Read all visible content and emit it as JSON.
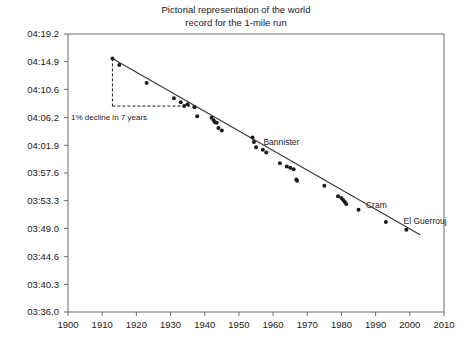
{
  "chart_data": {
    "type": "scatter",
    "title": "Pictorial representation of the world\nrecord for the 1-mile run",
    "xlabel": "",
    "ylabel": "",
    "xlim": [
      1900,
      2010
    ],
    "ylim_seconds": [
      216.0,
      259.2
    ],
    "grid": false,
    "legend": null,
    "xticks": [
      1900,
      1910,
      1920,
      1930,
      1940,
      1950,
      1960,
      1970,
      1980,
      1990,
      2000,
      2010
    ],
    "xtick_labels": [
      "1900",
      "1910",
      "1920",
      "1930",
      "1940",
      "1950",
      "1960",
      "1970",
      "1980",
      "1990",
      "2000",
      "2010"
    ],
    "yticks_seconds": [
      259.2,
      254.9,
      250.6,
      246.2,
      241.9,
      237.6,
      233.3,
      229.0,
      224.6,
      220.3,
      216.0
    ],
    "ytick_labels": [
      "04:19.2",
      "04:14.9",
      "04:10.6",
      "04:06.2",
      "04:01.9",
      "03:57.6",
      "03:53.3",
      "03:49.0",
      "03:44.6",
      "03:40.3",
      "03:36.0"
    ],
    "series": [
      {
        "name": "world record",
        "marker": "filled-circle",
        "color": "#1a1a1a",
        "points": [
          {
            "x": 1913,
            "y": 255.4
          },
          {
            "x": 1915,
            "y": 254.4
          },
          {
            "x": 1923,
            "y": 251.6
          },
          {
            "x": 1931,
            "y": 249.2
          },
          {
            "x": 1933,
            "y": 248.6
          },
          {
            "x": 1934,
            "y": 248.0
          },
          {
            "x": 1935,
            "y": 248.3
          },
          {
            "x": 1937,
            "y": 247.8
          },
          {
            "x": 1937.8,
            "y": 246.4
          },
          {
            "x": 1942,
            "y": 246.2
          },
          {
            "x": 1942.6,
            "y": 245.8
          },
          {
            "x": 1943,
            "y": 245.5
          },
          {
            "x": 1943.5,
            "y": 245.4
          },
          {
            "x": 1944,
            "y": 244.6
          },
          {
            "x": 1945,
            "y": 244.2
          },
          {
            "x": 1954,
            "y": 243.1
          },
          {
            "x": 1954.4,
            "y": 242.4
          },
          {
            "x": 1955,
            "y": 241.6
          },
          {
            "x": 1957,
            "y": 241.2
          },
          {
            "x": 1958,
            "y": 240.8
          },
          {
            "x": 1962,
            "y": 239.1
          },
          {
            "x": 1964,
            "y": 238.6
          },
          {
            "x": 1965,
            "y": 238.4
          },
          {
            "x": 1966,
            "y": 238.2
          },
          {
            "x": 1966.8,
            "y": 236.6
          },
          {
            "x": 1967,
            "y": 236.4
          },
          {
            "x": 1975,
            "y": 235.6
          },
          {
            "x": 1979,
            "y": 234.0
          },
          {
            "x": 1980,
            "y": 233.7
          },
          {
            "x": 1980.5,
            "y": 233.4
          },
          {
            "x": 1981,
            "y": 233.1
          },
          {
            "x": 1981.4,
            "y": 232.8
          },
          {
            "x": 1985,
            "y": 231.9
          },
          {
            "x": 1993,
            "y": 230.0
          },
          {
            "x": 1999,
            "y": 228.8
          }
        ]
      }
    ],
    "trendline": {
      "type": "linear",
      "from": {
        "x": 1913,
        "y": 255.4
      },
      "to": {
        "x": 2003,
        "y": 228.0
      }
    },
    "annotations": [
      {
        "name": "decline-annotation",
        "text": "1% decline in 7 years",
        "x": 1913,
        "y": 248.0
      },
      {
        "name": "bannister-label",
        "text": "Bannister",
        "x": 1956,
        "y": 242.4
      },
      {
        "name": "cram-label",
        "text": "Cram",
        "x": 1986,
        "y": 232.6
      },
      {
        "name": "el-guerrouj-label",
        "text": "El Guerrouj",
        "x": 1997,
        "y": 230.2
      }
    ],
    "colors": {
      "axis": "#6b6b6b",
      "marker": "#1a1a1a",
      "trendline": "#3a3a3a",
      "text": "#1a1a1a",
      "background": "#ffffff"
    }
  }
}
